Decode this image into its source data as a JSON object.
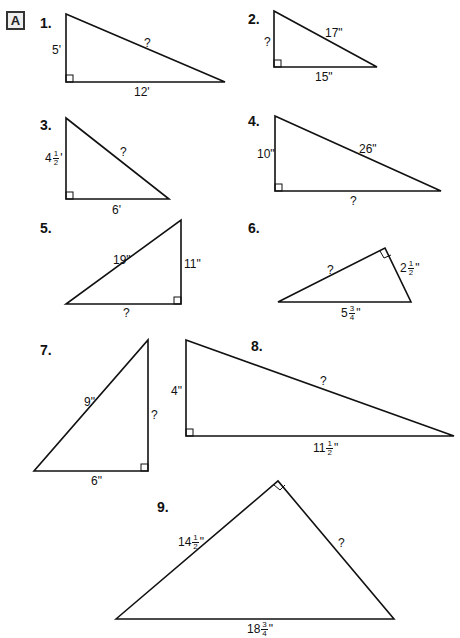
{
  "section": {
    "label": "A"
  },
  "problems": [
    {
      "number": "1.",
      "sides": {
        "a": "5'",
        "b": "12'",
        "c": "?"
      }
    },
    {
      "number": "2.",
      "sides": {
        "a": "?",
        "b": "15\"",
        "c": "17\""
      }
    },
    {
      "number": "3.",
      "sides": {
        "a_whole": "4",
        "a_num": "1",
        "a_den": "2",
        "a_unit": "'",
        "b": "6'",
        "c": "?"
      }
    },
    {
      "number": "4.",
      "sides": {
        "a": "10\"",
        "b": "?",
        "c": "26\""
      }
    },
    {
      "number": "5.",
      "sides": {
        "a": "11\"",
        "b": "?",
        "c": "19\""
      }
    },
    {
      "number": "6.",
      "sides": {
        "a_whole": "2",
        "a_num": "1",
        "a_den": "2",
        "a_unit": "\"",
        "b": "?",
        "c_whole": "5",
        "c_num": "3",
        "c_den": "4",
        "c_unit": "\""
      }
    },
    {
      "number": "7.",
      "sides": {
        "a": "?",
        "b": "6\"",
        "c": "9\""
      }
    },
    {
      "number": "8.",
      "sides": {
        "a": "4\"",
        "b_whole": "11",
        "b_num": "1",
        "b_den": "2",
        "b_unit": "\"",
        "c": "?"
      }
    },
    {
      "number": "9.",
      "sides": {
        "a_whole": "14",
        "a_num": "1",
        "a_den": "2",
        "a_unit": "\"",
        "b": "?",
        "c_whole": "18",
        "c_num": "3",
        "c_den": "4",
        "c_unit": "\""
      }
    }
  ]
}
